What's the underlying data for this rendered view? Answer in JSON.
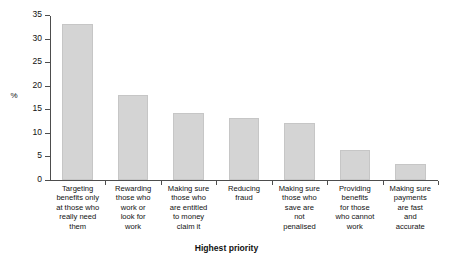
{
  "chart_data": {
    "type": "bar",
    "title": "",
    "xlabel": "Highest priority",
    "ylabel": "%",
    "ylim": [
      0,
      35
    ],
    "yticks": [
      0,
      5,
      10,
      15,
      20,
      25,
      30,
      35
    ],
    "grid": false,
    "legend": null,
    "bar_color": "#d4d4d4",
    "categories": [
      "Targeting benefits only at those who really need them",
      "Rewarding those who work or look for work",
      "Making sure those who are entitled to money claim it",
      "Reducing fraud",
      "Making sure those who save are not penalised",
      "Providing benefits for those who cannot work",
      "Making sure payments are fast and accurate"
    ],
    "category_lines": [
      [
        "Targeting",
        "benefits only",
        "at those who",
        "really need",
        "them"
      ],
      [
        "Rewarding",
        "those who",
        "work or",
        "look for",
        "work"
      ],
      [
        "Making sure",
        "those who",
        "are entitled",
        "to money",
        "claim it"
      ],
      [
        "Reducing",
        "fraud"
      ],
      [
        "Making sure",
        "those who",
        "save are",
        "not",
        "penalised"
      ],
      [
        "Providing",
        "benefits",
        "for those",
        "who cannot",
        "work"
      ],
      [
        "Making sure",
        "payments",
        "are fast",
        "and",
        "accurate"
      ]
    ],
    "values": [
      33,
      18,
      14.2,
      13.1,
      12.2,
      6.3,
      3.4
    ]
  }
}
